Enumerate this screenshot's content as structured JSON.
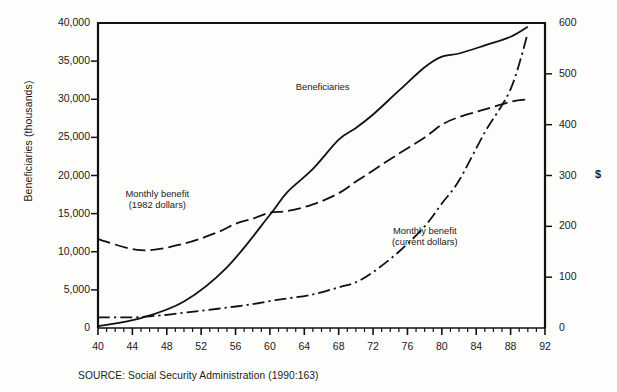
{
  "figure": {
    "source_note": "SOURCE:  Social Security Administration (1990:163)",
    "dollar_symbol": "$"
  },
  "chart_data": {
    "type": "line",
    "title": "",
    "xlabel": "",
    "ylabel": "Beneficiaries (thousands)",
    "ylabel_right": "$",
    "xlim": [
      40,
      92
    ],
    "ylim": [
      0,
      40000
    ],
    "ylim_right": [
      0,
      600
    ],
    "grid": false,
    "legend": "inline-annotations",
    "x_tick_labels": [
      "40",
      "44",
      "48",
      "52",
      "56",
      "60",
      "64",
      "68",
      "72",
      "76",
      "80",
      "84",
      "88",
      "92"
    ],
    "x_tick_values": [
      40,
      44,
      48,
      52,
      56,
      60,
      64,
      68,
      72,
      76,
      80,
      84,
      88,
      92
    ],
    "x_minor_tick_step": 1,
    "y_tick_labels": [
      "0",
      "5,000",
      "10,000",
      "15,000",
      "20,000",
      "25,000",
      "30,000",
      "35,000",
      "40,000"
    ],
    "y_tick_values": [
      0,
      5000,
      10000,
      15000,
      20000,
      25000,
      30000,
      35000,
      40000
    ],
    "y_right_tick_labels": [
      "0",
      "100",
      "200",
      "300",
      "400",
      "500",
      "600"
    ],
    "y_right_tick_values": [
      0,
      100,
      200,
      300,
      400,
      500,
      600
    ],
    "series": [
      {
        "name": "Beneficiaries",
        "axis": "left",
        "style": "solid",
        "label_text": "Beneficiaries",
        "x": [
          40,
          45,
          50,
          55,
          60,
          62,
          65,
          68,
          70,
          72,
          75,
          78,
          80,
          82,
          85,
          88,
          90
        ],
        "values": [
          222,
          1300,
          3477,
          7961,
          14845,
          17800,
          20867,
          24700,
          26229,
          28000,
          31123,
          34190,
          35585,
          36000,
          37058,
          38200,
          39500
        ]
      },
      {
        "name": "Monthly benefit (1982 dollars)",
        "axis": "right",
        "style": "dashed",
        "label_text": "Monthly benefit\n(1982 dollars)",
        "label_line1": "Monthly benefit",
        "label_line2": "(1982 dollars)",
        "x": [
          40,
          45,
          50,
          54,
          56,
          58,
          60,
          62,
          65,
          68,
          70,
          72,
          75,
          78,
          80,
          82,
          85,
          88,
          90
        ],
        "values": [
          175,
          153,
          166,
          189,
          205,
          215,
          227,
          230,
          243,
          265,
          288,
          310,
          343,
          375,
          400,
          415,
          430,
          445,
          450
        ]
      },
      {
        "name": "Monthly benefit (current dollars)",
        "axis": "right",
        "style": "dash-dot",
        "label_text": "Monthly benefit\n(current dollars)",
        "label_line1": "Monthly benefit",
        "label_line2": "(current dollars)",
        "x": [
          40,
          44,
          46,
          48,
          50,
          52,
          55,
          58,
          60,
          62,
          65,
          68,
          70,
          72,
          75,
          78,
          80,
          82,
          85,
          88,
          90
        ],
        "values": [
          21,
          21,
          23,
          26,
          30,
          34,
          40,
          47,
          53,
          58,
          66,
          80,
          90,
          110,
          150,
          200,
          245,
          290,
          385,
          470,
          580
        ]
      }
    ],
    "annotations": [
      {
        "text": "Beneficiaries",
        "x": 67,
        "y_left": 30500
      },
      {
        "text": "Monthly benefit (1982 dollars)",
        "x": 47,
        "y_right": 255
      },
      {
        "text": "Monthly benefit (current dollars)",
        "x": 77,
        "y_right": 175
      }
    ]
  }
}
